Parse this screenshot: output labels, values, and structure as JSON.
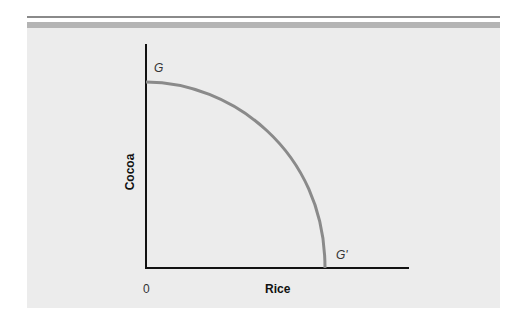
{
  "figure": {
    "type": "production possibilities frontier",
    "x_axis_label": "Rice",
    "y_axis_label": "Cocoa",
    "origin_label": "0",
    "curve_start_label": "G",
    "curve_end_label": "G'",
    "curve_color": "#8a8a8a",
    "axis_color": "#111111",
    "panel_color": "#ececec"
  }
}
